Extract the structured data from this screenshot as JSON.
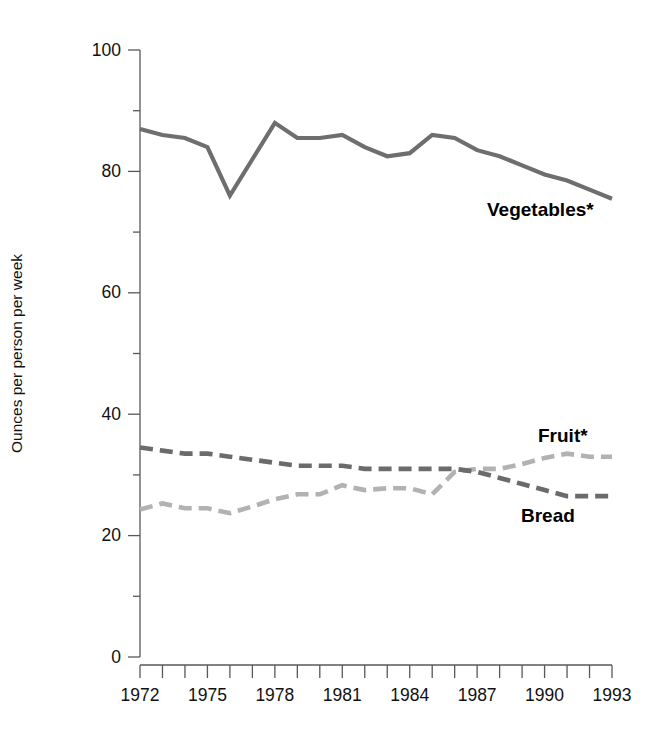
{
  "chart_data": {
    "type": "line",
    "title": "",
    "subtitle": "",
    "xlabel": "",
    "ylabel": "Ounces per person per week",
    "xlim": [
      1972,
      1993
    ],
    "ylim": [
      0,
      100
    ],
    "ytick_labels": [
      "0",
      "20",
      "40",
      "60",
      "80",
      "100"
    ],
    "ytick_values": [
      0,
      20,
      40,
      60,
      80,
      100
    ],
    "yminor_values": [
      10,
      30,
      50,
      70,
      90
    ],
    "xtick_labels": [
      "1972",
      "1975",
      "1978",
      "1981",
      "1984",
      "1987",
      "1990",
      "1993"
    ],
    "xtick_values": [
      1972,
      1975,
      1978,
      1981,
      1984,
      1987,
      1990,
      1993
    ],
    "x_all_ticks": [
      1972,
      1973,
      1974,
      1975,
      1976,
      1977,
      1978,
      1979,
      1980,
      1981,
      1982,
      1983,
      1984,
      1985,
      1986,
      1987,
      1988,
      1989,
      1990,
      1991,
      1992,
      1993
    ],
    "grid": false,
    "legend_position": "inline-right-annotations",
    "x": [
      1972,
      1973,
      1974,
      1975,
      1976,
      1977,
      1978,
      1979,
      1980,
      1981,
      1982,
      1983,
      1984,
      1985,
      1986,
      1987,
      1988,
      1989,
      1990,
      1991,
      1992,
      1993
    ],
    "series": [
      {
        "name": "Vegetables*",
        "label": "Vegetables*",
        "color": "#6e6e70",
        "style": "solid",
        "values": [
          87,
          86,
          85.5,
          84,
          76,
          82,
          88,
          85.5,
          85.5,
          86,
          84,
          82.5,
          83,
          86,
          85.5,
          83.5,
          82.5,
          81,
          79.5,
          78.5,
          77,
          75.5
        ]
      },
      {
        "name": "Bread",
        "label": "Bread",
        "color": "#6b6b6d",
        "style": "dashed",
        "values": [
          34.5,
          34,
          33.5,
          33.5,
          33,
          32.5,
          32,
          31.5,
          31.5,
          31.5,
          31,
          31,
          31,
          31,
          31,
          30.5,
          29.5,
          28.5,
          27.5,
          26.5,
          26.5,
          26.5
        ]
      },
      {
        "name": "Fruit*",
        "label": "Fruit*",
        "color": "#b2b2b4",
        "style": "dashed",
        "values": [
          24.3,
          25.3,
          24.5,
          24.5,
          23.7,
          24.8,
          26,
          26.8,
          26.8,
          28.3,
          27.5,
          27.8,
          27.8,
          26.8,
          30.5,
          31,
          31,
          31.8,
          32.8,
          33.5,
          33,
          33
        ]
      }
    ],
    "annotations": [
      {
        "text": "Vegetables*",
        "x_px": 487,
        "y_px": 216
      },
      {
        "text": "Fruit*",
        "x_px": 538,
        "y_px": 442
      },
      {
        "text": "Bread",
        "x_px": 521,
        "y_px": 522
      }
    ]
  },
  "plot": {
    "left_px": 140,
    "right_px": 612,
    "top_px": 50,
    "bottom_px": 657
  }
}
